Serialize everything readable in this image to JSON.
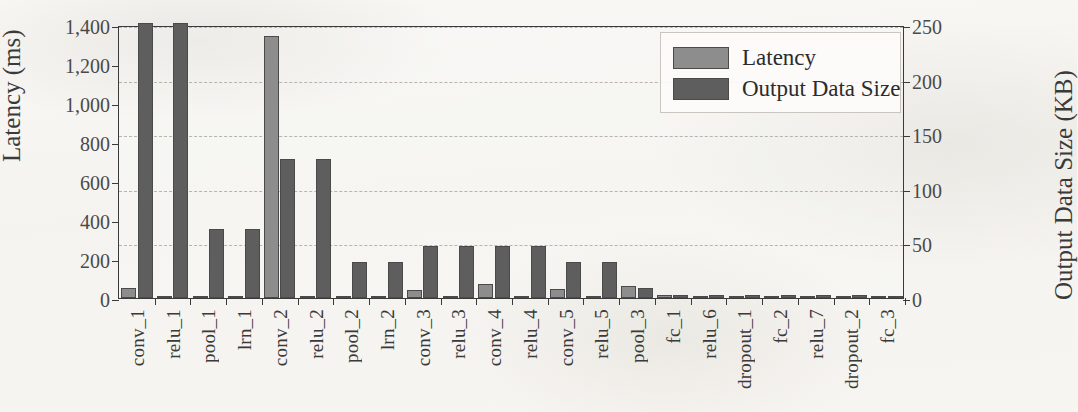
{
  "chart_data": {
    "type": "bar",
    "title": "",
    "xlabel": "",
    "ylabel": "Latency (ms)",
    "y2label": "Output Data Size (KB)",
    "ylim": [
      0,
      1400
    ],
    "y2lim": [
      0,
      250
    ],
    "ytick_labels": [
      "0",
      "200",
      "400",
      "600",
      "800",
      "1,000",
      "1,200",
      "1,400"
    ],
    "ytick_values": [
      0,
      200,
      400,
      600,
      800,
      1000,
      1200,
      1400
    ],
    "y2tick_labels": [
      "0",
      "50",
      "100",
      "150",
      "200",
      "250"
    ],
    "y2tick_values": [
      0,
      50,
      100,
      150,
      200,
      250
    ],
    "grid": "horizontal-dashed-on-right-axis",
    "legend_position": "top-right-inside",
    "categories": [
      "conv_1",
      "relu_1",
      "pool_1",
      "lrn_1",
      "conv_2",
      "relu_2",
      "pool_2",
      "lrn_2",
      "conv_3",
      "relu_3",
      "conv_4",
      "relu_4",
      "conv_5",
      "relu_5",
      "pool_3",
      "fc_1",
      "relu_6",
      "dropout_1",
      "fc_2",
      "relu_7",
      "dropout_2",
      "fc_3"
    ],
    "series": [
      {
        "name": "Latency",
        "axis": "left",
        "unit": "ms",
        "color": "#8d8d8d",
        "values": [
          50,
          0,
          6,
          5,
          1345,
          0,
          0,
          0,
          40,
          0,
          70,
          0,
          48,
          0,
          60,
          18,
          3,
          4,
          12,
          3,
          4,
          5
        ]
      },
      {
        "name": "Output Data Size",
        "axis": "right",
        "unit": "KB",
        "color": "#5e5e5e",
        "values": [
          252,
          252,
          63,
          63,
          127,
          127,
          33,
          33,
          48,
          48,
          48,
          48,
          33,
          33,
          9,
          3,
          3,
          3,
          3,
          3,
          3,
          1
        ]
      }
    ]
  },
  "legend": {
    "items": [
      {
        "label": "Latency",
        "swatch": "latency"
      },
      {
        "label": "Output Data Size",
        "swatch": "output"
      }
    ]
  }
}
